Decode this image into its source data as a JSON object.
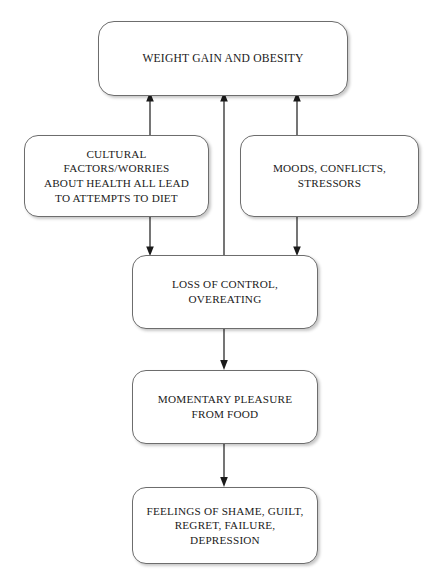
{
  "diagram": {
    "canvas": {
      "width": 439,
      "height": 580,
      "background": "#ffffff"
    },
    "style": {
      "box_border_color": "#6d6d6d",
      "box_fill_color": "#ffffff",
      "text_color": "#1a1a1a",
      "arrow_color": "#1a1a1a"
    },
    "nodes": [
      {
        "id": "weight-gain",
        "label": "WEIGHT GAIN AND OBESITY",
        "x": 98,
        "y": 21,
        "width": 250,
        "height": 75
      },
      {
        "id": "cultural-factors",
        "label": "CULTURAL\nFACTORS/WORRIES\nABOUT HEALTH ALL LEAD\nTO ATTEMPTS TO DIET",
        "x": 24,
        "y": 135,
        "width": 185,
        "height": 82
      },
      {
        "id": "moods-conflicts",
        "label": "MOODS, CONFLICTS,\nSTRESSORS",
        "x": 240,
        "y": 135,
        "width": 179,
        "height": 82
      },
      {
        "id": "loss-of-control",
        "label": "LOSS OF CONTROL,\nOVEREATING",
        "x": 132,
        "y": 255,
        "width": 186,
        "height": 74
      },
      {
        "id": "momentary-pleasure",
        "label": "MOMENTARY PLEASURE\nFROM FOOD",
        "x": 132,
        "y": 370,
        "width": 186,
        "height": 74
      },
      {
        "id": "feelings-shame",
        "label": "FEELINGS OF SHAME, GUILT,\nREGRET, FAILURE,\nDEPRESSION",
        "x": 132,
        "y": 487,
        "width": 186,
        "height": 77
      }
    ],
    "edges": [
      {
        "id": "cultural-to-weight",
        "from": "cultural-factors",
        "to": "weight-gain",
        "direction": "up"
      },
      {
        "id": "loss-to-weight",
        "from": "loss-of-control",
        "to": "weight-gain",
        "direction": "up"
      },
      {
        "id": "moods-to-weight",
        "from": "moods-conflicts",
        "to": "weight-gain",
        "direction": "up"
      },
      {
        "id": "cultural-to-loss",
        "from": "cultural-factors",
        "to": "loss-of-control",
        "direction": "down"
      },
      {
        "id": "moods-to-loss",
        "from": "moods-conflicts",
        "to": "loss-of-control",
        "direction": "down"
      },
      {
        "id": "loss-to-pleasure",
        "from": "loss-of-control",
        "to": "momentary-pleasure",
        "direction": "down"
      },
      {
        "id": "pleasure-to-feelings",
        "from": "momentary-pleasure",
        "to": "feelings-shame",
        "direction": "down"
      }
    ]
  }
}
